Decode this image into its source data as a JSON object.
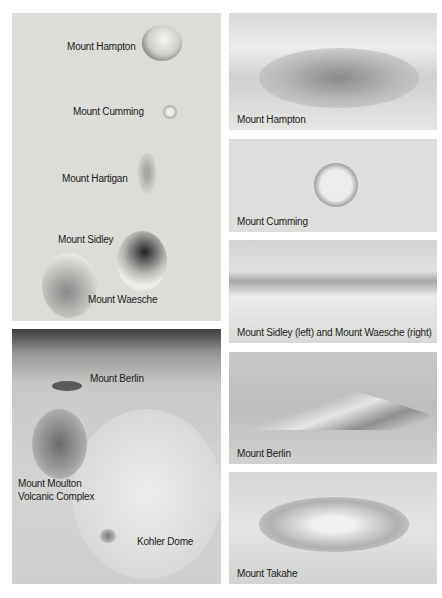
{
  "left_map": {
    "labels": {
      "hampton": "Mount Hampton",
      "cumming": "Mount Cumming",
      "hartigan": "Mount Hartigan",
      "sidley": "Mount Sidley",
      "waesche": "Mount Waesche"
    }
  },
  "left_aerial": {
    "labels": {
      "berlin": "Mount Berlin",
      "moulton_1": "Mount Moulton",
      "moulton_2": "Volcanic Complex",
      "kohler": "Kohler Dome"
    }
  },
  "photos": [
    {
      "caption": "Mount Hampton"
    },
    {
      "caption": "Mount Cumming"
    },
    {
      "caption": "Mount Sidley (left) and Mount Waesche (right)"
    },
    {
      "caption": "Mount Berlin"
    },
    {
      "caption": "Mount Takahe"
    }
  ]
}
